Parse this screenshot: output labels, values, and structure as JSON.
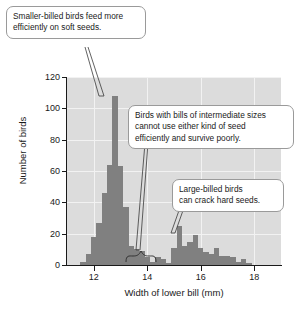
{
  "chart_data": {
    "type": "bar",
    "title": "",
    "subtitle": "",
    "xlabel": "Width of lower bill (mm)",
    "ylabel": "Number of birds",
    "xlim": [
      11.0,
      19.0
    ],
    "ylim": [
      0,
      120
    ],
    "xticks": [
      12,
      14,
      16,
      18
    ],
    "yticks": [
      0,
      20,
      40,
      60,
      80,
      100,
      120
    ],
    "grid": true,
    "legend": null,
    "bar_color": "#808080",
    "plot_background": "#dcdcdc",
    "bin_width": 0.2,
    "x": [
      11.6,
      11.8,
      12.0,
      12.2,
      12.4,
      12.6,
      12.8,
      13.0,
      13.2,
      13.4,
      13.6,
      13.8,
      14.0,
      14.2,
      14.4,
      14.6,
      14.8,
      15.0,
      15.2,
      15.4,
      15.6,
      15.8,
      16.0,
      16.2,
      16.4,
      16.6,
      16.8,
      17.0,
      17.2,
      17.4,
      17.6,
      17.8
    ],
    "values": [
      2,
      7,
      18,
      27,
      46,
      64,
      108,
      63,
      37,
      12,
      10,
      9,
      5,
      2,
      5,
      4,
      1,
      11,
      25,
      12,
      15,
      19,
      11,
      8,
      7,
      11,
      6,
      6,
      5,
      2,
      4,
      1
    ]
  },
  "axis": {
    "y_title": "Number of birds",
    "x_title": "Width of lower bill (mm)",
    "y_ticks": [
      "120",
      "100",
      "80",
      "60",
      "40",
      "20",
      "0"
    ],
    "x_ticks": [
      "12",
      "14",
      "16",
      "18"
    ]
  },
  "callouts": {
    "smaller_billed": {
      "lines": [
        "Smaller-billed birds feed more",
        "efficiently on soft seeds."
      ]
    },
    "intermediate": {
      "lines": [
        "Birds with bills of intermediate sizes",
        "cannot use either kind of seed",
        "efficiently and survive poorly."
      ]
    },
    "large_billed": {
      "lines": [
        "Large-billed birds",
        "can crack hard seeds."
      ]
    }
  },
  "colors": {
    "bar": "#808080",
    "plot_bg": "#dcdcdc",
    "gridline": "#f2f2f2",
    "callout_border": "#9a9a9a",
    "text": "#1a1a1a"
  }
}
